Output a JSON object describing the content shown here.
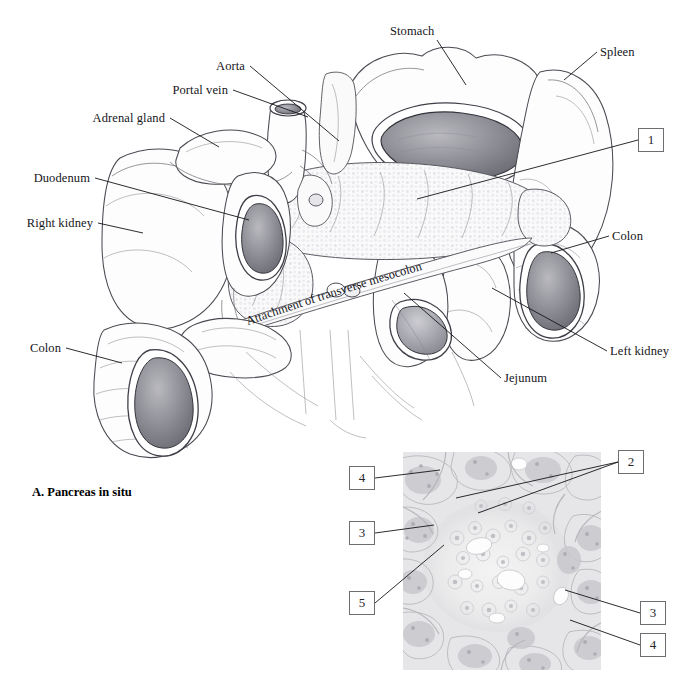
{
  "figure": {
    "caption": "A. Pancreas in situ",
    "panel_a_title": "A. Pancreas in situ"
  },
  "labels": [
    {
      "id": "stomach",
      "text": "Stomach",
      "x": 390,
      "y": 35,
      "align": "left",
      "lx1": 437,
      "ly1": 40,
      "lx2": 466,
      "ly2": 85
    },
    {
      "id": "spleen",
      "text": "Spleen",
      "x": 600,
      "y": 56,
      "align": "left",
      "lx1": 597,
      "ly1": 52,
      "lx2": 564,
      "ly2": 80
    },
    {
      "id": "aorta",
      "text": "Aorta",
      "x": 245,
      "y": 70,
      "align": "right",
      "lx1": 250,
      "ly1": 66,
      "lx2": 339,
      "ly2": 141
    },
    {
      "id": "portal-vein",
      "text": "Portal vein",
      "x": 228,
      "y": 94,
      "align": "right",
      "lx1": 233,
      "ly1": 90,
      "lx2": 308,
      "ly2": 117
    },
    {
      "id": "adrenal-gland",
      "text": "Adrenal gland",
      "x": 165,
      "y": 122,
      "align": "right",
      "lx1": 170,
      "ly1": 118,
      "lx2": 219,
      "ly2": 147
    },
    {
      "id": "duodenum",
      "text": "Duodenum",
      "x": 90,
      "y": 182,
      "align": "right",
      "lx1": 95,
      "ly1": 178,
      "lx2": 249,
      "ly2": 220
    },
    {
      "id": "right-kidney",
      "text": "Right kidney",
      "x": 93,
      "y": 227,
      "align": "right",
      "lx1": 98,
      "ly1": 223,
      "lx2": 143,
      "ly2": 233
    },
    {
      "id": "colon-right",
      "text": "Colon",
      "x": 30,
      "y": 352,
      "align": "left",
      "lx1": 66,
      "ly1": 348,
      "lx2": 122,
      "ly2": 363
    },
    {
      "id": "colon-left",
      "text": "Colon",
      "x": 612,
      "y": 240,
      "align": "left",
      "lx1": 609,
      "ly1": 236,
      "lx2": 551,
      "ly2": 253
    },
    {
      "id": "left-kidney",
      "text": "Left kidney",
      "x": 610,
      "y": 355,
      "align": "left",
      "lx1": 607,
      "ly1": 351,
      "lx2": 492,
      "ly2": 288
    },
    {
      "id": "jejunum",
      "text": "Jejunum",
      "x": 504,
      "y": 382,
      "align": "left",
      "lx1": 501,
      "ly1": 378,
      "lx2": 404,
      "ly2": 293
    }
  ],
  "curved_label": {
    "id": "attachment-of-transverse-mesocolon",
    "text": "Attachment of transverse mesocolon"
  },
  "callouts": [
    {
      "id": "callout-1",
      "number": "1",
      "x": 638,
      "y": 128,
      "lx1": 638,
      "ly1": 140,
      "lx2": 417,
      "ly2": 199
    },
    {
      "id": "callout-2",
      "number": "2",
      "x": 618,
      "y": 450,
      "lx1": 618,
      "ly1": 462,
      "lx2": 456,
      "ly2": 498
    },
    {
      "id": "callout-2b",
      "number": "2",
      "x": 618,
      "y": 450,
      "lx1": 618,
      "ly1": 462,
      "lx2": 478,
      "ly2": 513
    },
    {
      "id": "callout-4-topleft",
      "number": "4",
      "x": 349,
      "y": 466,
      "lx1": 375,
      "ly1": 478,
      "lx2": 440,
      "ly2": 470
    },
    {
      "id": "callout-3-left",
      "number": "3",
      "x": 349,
      "y": 521,
      "lx1": 375,
      "ly1": 533,
      "lx2": 434,
      "ly2": 525
    },
    {
      "id": "callout-5",
      "number": "5",
      "x": 349,
      "y": 591,
      "lx1": 375,
      "ly1": 603,
      "lx2": 444,
      "ly2": 545
    },
    {
      "id": "callout-3-right",
      "number": "3",
      "x": 640,
      "y": 601,
      "lx1": 640,
      "ly1": 613,
      "lx2": 565,
      "ly2": 590
    },
    {
      "id": "callout-4-bottomright",
      "number": "4",
      "x": 640,
      "y": 633,
      "lx1": 640,
      "ly1": 645,
      "lx2": 570,
      "ly2": 620
    }
  ],
  "micrograph": {
    "id": "pancreas-histology",
    "x": 403,
    "y": 452,
    "width": 198,
    "height": 218,
    "description": "Pancreas histology section"
  },
  "colors": {
    "background": "#ffffff",
    "line": "#15151a",
    "organ_stroke": "#4a4a52",
    "organ_fill": "#fdfdfd",
    "callout_border": "#6d6d72",
    "micrograph_base": "#e9e9ea"
  }
}
